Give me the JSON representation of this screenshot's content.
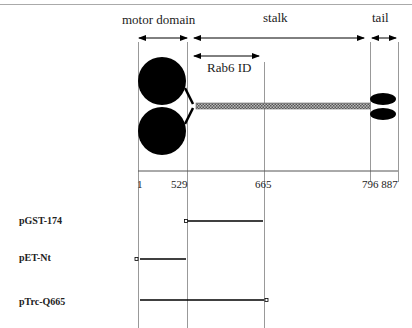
{
  "diagram": {
    "domains": [
      {
        "label": "motor domain",
        "range": [
          1,
          529
        ]
      },
      {
        "label": "stalk",
        "range": [
          529,
          796
        ]
      },
      {
        "label": "tail",
        "range": [
          796,
          887
        ]
      }
    ],
    "subdomain": {
      "label": "Rab6 ID",
      "range": [
        529,
        665
      ]
    },
    "axis_ticks": [
      "1",
      "529",
      "665",
      "796 887"
    ],
    "constructs": [
      {
        "name": "pGST-174",
        "range": [
          529,
          665
        ],
        "marker_end": "start"
      },
      {
        "name": "pET-Nt",
        "range": [
          1,
          529
        ],
        "marker_end": "start"
      },
      {
        "name": "pTrc-Q665",
        "range": [
          1,
          665
        ],
        "marker_end": "end"
      }
    ],
    "colors": {
      "fill": "#000000",
      "guide": "#999999",
      "stalk": "#888888"
    }
  }
}
